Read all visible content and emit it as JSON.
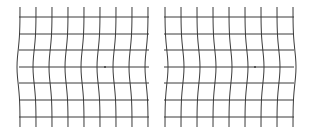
{
  "diagram": {
    "width": 310,
    "height": 133,
    "background": "#ffffff",
    "line_color": "#3a3a3a",
    "line_width": 1,
    "grids": [
      {
        "name": "left-grid",
        "x_lines": [
          20,
          36,
          52,
          68,
          84,
          100,
          116,
          132,
          148
        ],
        "y_lines": [
          17,
          34,
          50,
          67,
          83,
          100,
          117
        ],
        "y_top": 7,
        "y_bottom": 127,
        "x_left": 19,
        "x_right": 149,
        "bulge_direction": -1,
        "bulge_amount": 3,
        "center_y": 67,
        "fixation_dot": {
          "x": 105,
          "y": 67
        }
      },
      {
        "name": "right-grid",
        "x_lines": [
          165,
          181,
          197,
          213,
          229,
          245,
          261,
          277,
          293
        ],
        "y_lines": [
          17,
          34,
          50,
          67,
          83,
          100,
          117
        ],
        "y_top": 7,
        "y_bottom": 127,
        "x_left": 164,
        "x_right": 294,
        "bulge_direction": 1,
        "bulge_amount": 3,
        "center_y": 67,
        "fixation_dot": {
          "x": 255,
          "y": 67
        }
      }
    ]
  }
}
